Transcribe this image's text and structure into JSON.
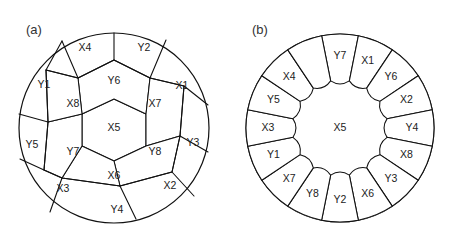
{
  "figure": {
    "background": "#ffffff",
    "stroke_color": "#111111",
    "text_color": "#222222"
  },
  "panels": [
    {
      "id": "a",
      "label": "(a)",
      "label_x": 26,
      "label_y": 30,
      "center_x": 114,
      "center_y": 128,
      "radius": 95,
      "description": "honeycomb-packing",
      "center_cell": {
        "label": "X5",
        "x": 114,
        "y": 128
      },
      "middle_ring": [
        {
          "label": "Y6",
          "x": 114,
          "y": 81
        },
        {
          "label": "X7",
          "x": 155,
          "y": 104
        },
        {
          "label": "Y8",
          "x": 155,
          "y": 152
        },
        {
          "label": "X6",
          "x": 114,
          "y": 176
        },
        {
          "label": "Y7",
          "x": 73,
          "y": 152
        },
        {
          "label": "X8",
          "x": 73,
          "y": 104
        }
      ],
      "outer_ring": [
        {
          "label": "Y2",
          "x": 144,
          "y": 48
        },
        {
          "label": "X1",
          "x": 182,
          "y": 86
        },
        {
          "label": "Y3",
          "x": 193,
          "y": 143
        },
        {
          "label": "X2",
          "x": 170,
          "y": 186
        },
        {
          "label": "Y4",
          "x": 117,
          "y": 210
        },
        {
          "label": "X3",
          "x": 63,
          "y": 189
        },
        {
          "label": "Y5",
          "x": 32,
          "y": 145
        },
        {
          "label": "Y1",
          "x": 44,
          "y": 85
        },
        {
          "label": "X4",
          "x": 85,
          "y": 48
        }
      ]
    },
    {
      "id": "b",
      "label": "(b)",
      "label_x": 252,
      "label_y": 30,
      "center_x": 340,
      "center_y": 128,
      "radius": 94,
      "inner_radius": 44,
      "description": "radial-wedge-packing",
      "center_cell": {
        "label": "X5",
        "x": 340,
        "y": 128
      },
      "wedges": [
        {
          "label": "Y7",
          "angle": -78
        },
        {
          "label": "X1",
          "angle": -56
        },
        {
          "label": "Y6",
          "angle": -33
        },
        {
          "label": "X2",
          "angle": -11
        },
        {
          "label": "Y4",
          "angle": 12
        },
        {
          "label": "X8",
          "angle": 34
        },
        {
          "label": "Y3",
          "angle": 56
        },
        {
          "label": "X6",
          "angle": 78
        },
        {
          "label": "Y2",
          "angle": 101
        },
        {
          "label": "Y8",
          "angle": 124
        },
        {
          "label": "X7",
          "angle": 146
        },
        {
          "label": "Y1",
          "angle": 169
        },
        {
          "label": "X3",
          "angle": 191
        },
        {
          "label": "Y5",
          "angle": 214
        },
        {
          "label": "X4",
          "angle": 236
        },
        {
          "label": "",
          "angle": 259
        }
      ]
    }
  ]
}
